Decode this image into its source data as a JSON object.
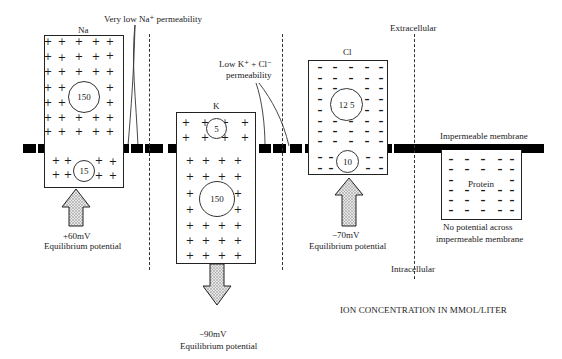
{
  "diagram": {
    "labels": {
      "very_low_na": "Very low Na⁺ permeability",
      "low_k_cl_line1": "Low K⁺ + Cl⁻",
      "low_k_cl_line2": "permeability",
      "extracellular": "Extracellular",
      "intracellular": "Intracellular",
      "impermeable_membrane": "Impermeable membrane",
      "footer": "ION CONCENTRATION IN MMOL/LITER"
    },
    "ions": [
      {
        "name": "Na",
        "outside_conc": "150",
        "inside_conc": "15",
        "symbol": "+",
        "potential": "+60mV",
        "potential_label": "Equilibrium potential",
        "arrow_direction": "up"
      },
      {
        "name": "K",
        "outside_conc": "5",
        "inside_conc": "150",
        "symbol": "+",
        "potential": "−90mV",
        "potential_label": "Equilibrium potential",
        "arrow_direction": "down"
      },
      {
        "name": "Cl",
        "outside_conc": "12 5",
        "inside_conc": "10",
        "symbol": "–",
        "potential": "−70mV",
        "potential_label": "Equilibrium potential",
        "arrow_direction": "up"
      }
    ],
    "protein": {
      "label": "Protein",
      "symbol": "–",
      "note_line1": "No potential across",
      "note_line2": "impermeable membrane"
    }
  }
}
